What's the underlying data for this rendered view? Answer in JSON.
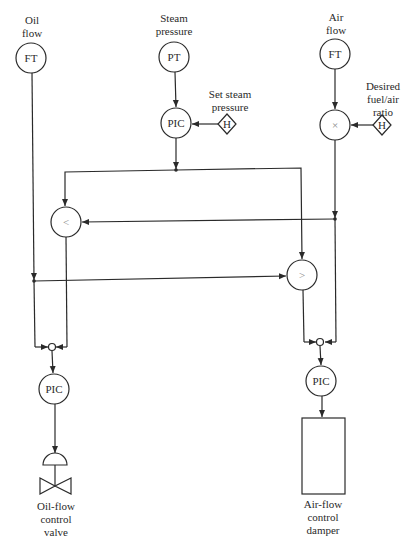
{
  "diagram": {
    "type": "control-loop-schematic",
    "inputs": {
      "oil_flow": {
        "label_line1": "Oil",
        "label_line2": "flow",
        "instrument": "FT"
      },
      "steam_pressure": {
        "label_line1": "Steam",
        "label_line2": "pressure",
        "instrument": "PT"
      },
      "air_flow": {
        "label_line1": "Air",
        "label_line2": "flow",
        "instrument": "FT"
      }
    },
    "setpoints": {
      "steam": {
        "label_line1": "Set steam",
        "label_line2": "pressure",
        "symbol": "H"
      },
      "ratio": {
        "label_line1": "Desired",
        "label_line2": "fuel/air",
        "label_line3": "ratio",
        "symbol": "H"
      }
    },
    "controllers": {
      "steam_pic": "PIC",
      "multiplier": "×",
      "low_select": "<",
      "high_select": ">",
      "oil_pic": "PIC",
      "air_pic": "PIC"
    },
    "outputs": {
      "oil_valve": {
        "line1": "Oil-flow",
        "line2": "control",
        "line3": "valve"
      },
      "air_damper": {
        "line1": "Air-flow",
        "line2": "control",
        "line3": "damper"
      }
    }
  }
}
